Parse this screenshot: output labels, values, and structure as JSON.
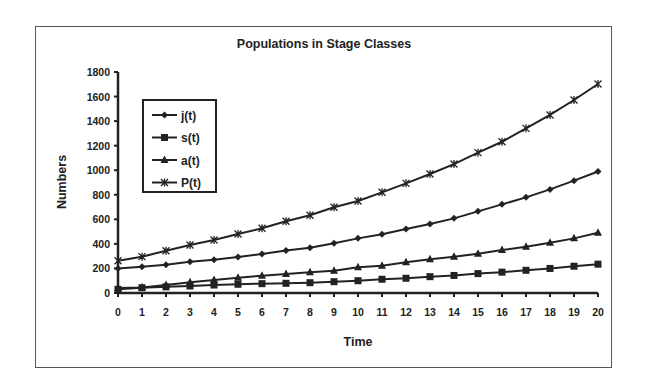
{
  "chart_data": {
    "type": "line",
    "title": "Populations in Stage Classes",
    "xlabel": "Time",
    "ylabel": "Numbers",
    "x": [
      0,
      1,
      2,
      3,
      4,
      5,
      6,
      7,
      8,
      9,
      10,
      11,
      12,
      13,
      14,
      15,
      16,
      17,
      18,
      19,
      20
    ],
    "xlim": [
      0,
      20
    ],
    "ylim": [
      0,
      1800
    ],
    "yticks": [
      0,
      200,
      400,
      600,
      800,
      1000,
      1200,
      1400,
      1600,
      1800
    ],
    "xticks": [
      0,
      1,
      2,
      3,
      4,
      5,
      6,
      7,
      8,
      9,
      10,
      11,
      12,
      13,
      14,
      15,
      16,
      17,
      18,
      19,
      20
    ],
    "grid": false,
    "legend_position": "upper-left inside plot",
    "series": [
      {
        "name": "j(t)",
        "marker": "diamond",
        "values": [
          200,
          214,
          230,
          255,
          270,
          293,
          318,
          346,
          369,
          405,
          445,
          478,
          521,
          562,
          608,
          665,
          722,
          779,
          844,
          915,
          990
        ]
      },
      {
        "name": "s(t)",
        "marker": "square",
        "values": [
          30,
          43,
          50,
          57,
          65,
          71,
          76,
          79,
          84,
          92,
          100,
          112,
          120,
          133,
          143,
          158,
          170,
          185,
          200,
          218,
          235
        ]
      },
      {
        "name": "a(t)",
        "marker": "triangle",
        "values": [
          40,
          45,
          65,
          87,
          106,
          125,
          141,
          155,
          169,
          182,
          209,
          222,
          250,
          274,
          296,
          320,
          350,
          377,
          410,
          445,
          490
        ]
      },
      {
        "name": "P(t)",
        "marker": "x-star",
        "values": [
          263,
          296,
          344,
          391,
          432,
          480,
          527,
          585,
          633,
          698,
          749,
          820,
          893,
          969,
          1050,
          1143,
          1232,
          1341,
          1450,
          1572,
          1702
        ]
      }
    ]
  },
  "legend": {
    "items": [
      "j(t)",
      "s(t)",
      "a(t)",
      "P(t)"
    ]
  },
  "colors": {
    "line": "#222222",
    "frame": "#555555",
    "background": "#ffffff"
  }
}
